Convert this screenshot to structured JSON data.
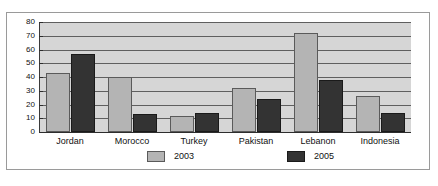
{
  "chart_data": {
    "type": "bar",
    "title": "",
    "xlabel": "",
    "ylabel": "",
    "ylim": [
      0,
      80
    ],
    "yticks": [
      0,
      10,
      20,
      30,
      40,
      50,
      60,
      70,
      80
    ],
    "grid": true,
    "legend_position": "bottom",
    "categories": [
      "Jordan",
      "Morocco",
      "Turkey",
      "Pakistan",
      "Lebanon",
      "Indonesia"
    ],
    "series": [
      {
        "name": "2003",
        "color": "#b4b4b4",
        "values": [
          43,
          40,
          12,
          32,
          72,
          26
        ]
      },
      {
        "name": "2005",
        "color": "#333333",
        "values": [
          57,
          13,
          14,
          24,
          38,
          14
        ]
      }
    ]
  },
  "legend": {
    "items": [
      {
        "label": "2003"
      },
      {
        "label": "2005"
      }
    ]
  }
}
